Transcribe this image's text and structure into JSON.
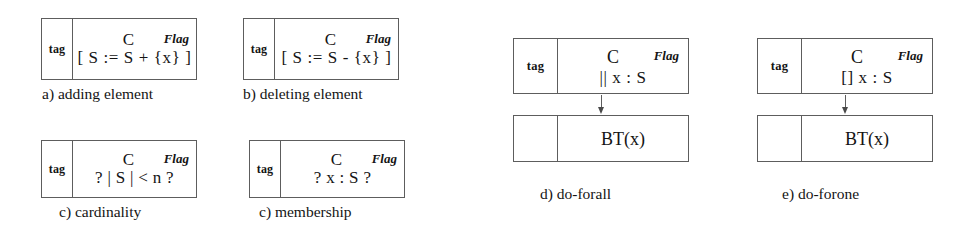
{
  "figure": {
    "background_color": "#ffffff",
    "line_color": "#5d5d5d",
    "text_color": "#141414",
    "panels": [
      {
        "id": "a",
        "caption": "a) adding element",
        "tag": "tag",
        "header_left": "C",
        "header_right": "Flag",
        "expression": "[ S := S + {x} ]"
      },
      {
        "id": "b",
        "caption": "b) deleting element",
        "tag": "tag",
        "header_left": "C",
        "header_right": "Flag",
        "expression": "[ S := S - {x} ]"
      },
      {
        "id": "c",
        "caption": "c) cardinality",
        "tag": "tag",
        "header_left": "C",
        "header_right": "Flag",
        "expression": "? | S | < n ?"
      },
      {
        "id": "membership",
        "caption": "c) membership",
        "tag": "tag",
        "header_left": "C",
        "header_right": "Flag",
        "expression": "? x : S ?"
      },
      {
        "id": "forall",
        "caption": "d) do-forall",
        "tag": "tag",
        "header_left": "C",
        "header_right": "Flag",
        "expression": "|| x : S",
        "child_tag": "",
        "child_expression": "BT(x)"
      },
      {
        "id": "forone",
        "caption": "e) do-forone",
        "tag": "tag",
        "header_left": "C",
        "header_right": "Flag",
        "expression": "[] x : S",
        "child_tag": "",
        "child_expression": "BT(x)"
      }
    ]
  }
}
